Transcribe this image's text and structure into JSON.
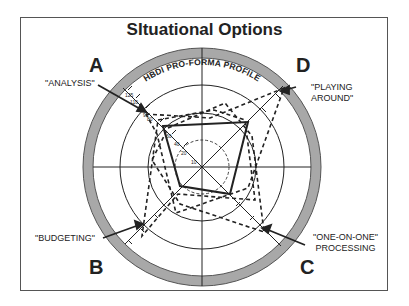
{
  "title": "SItuational Options",
  "ring_label": "HBDI PRO-FORMA PROFILE",
  "quadrants": {
    "a": "A",
    "b": "B",
    "c": "C",
    "d": "D"
  },
  "callouts": {
    "analysis": "\"ANALYSIS\"",
    "playing_1": "\"PLAYING",
    "playing_2": "AROUND\"",
    "budgeting": "\"BUDGETING\"",
    "oneonone_1": "\"ONE-ON-ONE\"",
    "oneonone_2": "PROCESSING"
  },
  "scale_ticks": [
    "10",
    "20",
    "40",
    "60",
    "80",
    "90",
    "110",
    "125"
  ],
  "colors": {
    "ring": "#a8a8a8",
    "line": "#222222",
    "frame": "#555555"
  }
}
